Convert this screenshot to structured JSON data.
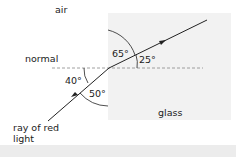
{
  "diagram": {
    "media": {
      "air_label": "air",
      "glass_label": "glass"
    },
    "normal_label": "normal",
    "ray_label_line1": "ray of red",
    "ray_label_line2": "light",
    "angles": {
      "incidence_to_surface": "40°",
      "incidence_to_normal": "50°",
      "refraction_to_normal": "65°",
      "refraction_to_surface": "25°"
    },
    "colors": {
      "glass_fill": "#f2f2f2",
      "ray": "#222222",
      "normal_line": "#888888",
      "text": "#222222",
      "bottom_band": "#ececec"
    }
  }
}
